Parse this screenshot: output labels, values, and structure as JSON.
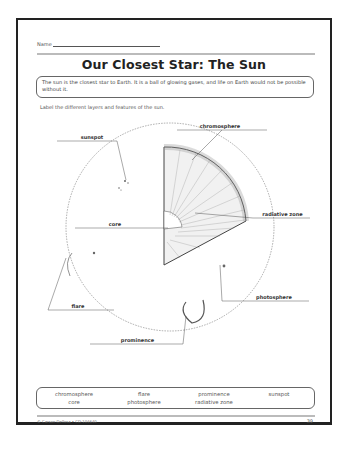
{
  "worksheet": {
    "name_label": "Name",
    "title": "Our Closest Star: The Sun",
    "intro_text": "The sun is the closest star to Earth. It is a ball of glowing gases, and life on Earth would not be possible without it.",
    "instruction": "Label the different layers and features of the sun."
  },
  "diagram": {
    "labels": {
      "sunspot": "sunspot",
      "chromosphere": "chromosphere",
      "radiative_zone": "radiative zone",
      "core": "core",
      "photosphere": "photosphere",
      "flare": "flare",
      "prominence": "prominence"
    }
  },
  "word_bank": {
    "words": [
      "chromosphere",
      "core",
      "flare",
      "photosphere",
      "prominence",
      "radiative zone",
      "sunspot"
    ]
  },
  "footer": {
    "copyright": "© Carson-Dellosa • CD-104640",
    "page_number": "39"
  }
}
